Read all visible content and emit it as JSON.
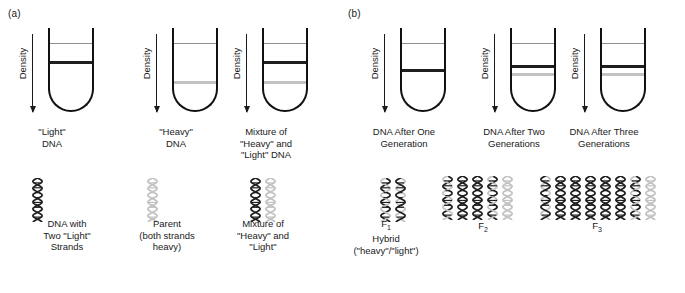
{
  "figure": {
    "panels": [
      {
        "label": "(a)"
      },
      {
        "label": "(b)"
      }
    ],
    "axis_label": "Density",
    "colors": {
      "heavy_strand": "#1f1f1f",
      "light_strand": "#c2c2c2",
      "tube_outline": "#111111",
      "meniscus": "#8e8e8e",
      "background": "#ffffff"
    }
  },
  "tubes": [
    {
      "id": "tube-light-dna",
      "axis_label": "Density",
      "caption": "\"Light\"\nDNA",
      "caption_lines": [
        "\"Light\"",
        "DNA"
      ],
      "bands": [
        {
          "type": "meniscus",
          "position_pct": 16
        },
        {
          "type": "dark",
          "position_pct": 36
        }
      ]
    },
    {
      "id": "tube-heavy-dna",
      "axis_label": "Density",
      "caption_lines": [
        "\"Heavy\"",
        "DNA"
      ],
      "bands": [
        {
          "type": "meniscus",
          "position_pct": 16
        },
        {
          "type": "light",
          "position_pct": 58
        }
      ]
    },
    {
      "id": "tube-mixture-heavy-light",
      "axis_label": "Density",
      "caption_lines": [
        "Mixture of",
        "\"Heavy\" and",
        "\"Light\" DNA"
      ],
      "bands": [
        {
          "type": "meniscus",
          "position_pct": 16
        },
        {
          "type": "dark",
          "position_pct": 36
        },
        {
          "type": "light",
          "position_pct": 58
        }
      ]
    },
    {
      "id": "tube-one-generation",
      "axis_label": "Density",
      "caption_lines": [
        "DNA After One",
        "Generation"
      ],
      "bands": [
        {
          "type": "meniscus",
          "position_pct": 16
        },
        {
          "type": "dark",
          "position_pct": 45
        }
      ]
    },
    {
      "id": "tube-two-generations",
      "axis_label": "Density",
      "caption_lines": [
        "DNA After Two",
        "Generations"
      ],
      "bands": [
        {
          "type": "meniscus",
          "position_pct": 16
        },
        {
          "type": "dark",
          "position_pct": 40
        },
        {
          "type": "light",
          "position_pct": 49
        }
      ]
    },
    {
      "id": "tube-three-generations",
      "axis_label": "Density",
      "caption_lines": [
        "DNA After Three",
        "Generations"
      ],
      "bands": [
        {
          "type": "meniscus",
          "position_pct": 16
        },
        {
          "type": "dark",
          "position_pct": 40
        },
        {
          "type": "light",
          "position_pct": 49
        }
      ]
    }
  ],
  "helix_groups": [
    {
      "id": "helix-light-dna",
      "caption_lines": [
        "DNA with",
        "Two \"Light\"",
        "Strands"
      ],
      "helices": [
        {
          "strands": [
            "dark",
            "dark"
          ]
        }
      ]
    },
    {
      "id": "helix-parent-heavy",
      "caption_lines": [
        "Parent",
        "(both strands",
        "heavy)"
      ],
      "helices": [
        {
          "strands": [
            "light",
            "light"
          ]
        }
      ]
    },
    {
      "id": "helix-mixture",
      "caption_lines": [
        "Mixture of",
        "\"Heavy\" and",
        "\"Light\""
      ],
      "helices": [
        {
          "strands": [
            "dark",
            "dark"
          ]
        },
        {
          "strands": [
            "light",
            "light"
          ]
        }
      ]
    },
    {
      "id": "helix-f1-hybrid",
      "caption_lines": [
        "F1",
        "Hybrid",
        "(\"heavy\"/\"light\")"
      ],
      "caption_main": "F",
      "caption_sub": "1",
      "helices": [
        {
          "strands": [
            "dark",
            "light"
          ]
        },
        {
          "strands": [
            "light",
            "dark"
          ]
        }
      ]
    },
    {
      "id": "helix-f2",
      "caption_main": "F",
      "caption_sub": "2",
      "caption_lines": [
        "F2"
      ],
      "helices": [
        {
          "strands": [
            "dark",
            "light"
          ]
        },
        {
          "strands": [
            "dark",
            "dark"
          ]
        },
        {
          "strands": [
            "dark",
            "dark"
          ]
        },
        {
          "strands": [
            "dark",
            "light"
          ]
        },
        {
          "strands": [
            "light",
            "light"
          ]
        }
      ]
    },
    {
      "id": "helix-f3",
      "caption_main": "F",
      "caption_sub": "3",
      "caption_lines": [
        "F3"
      ],
      "helices": [
        {
          "strands": [
            "light",
            "dark"
          ]
        },
        {
          "strands": [
            "dark",
            "dark"
          ]
        },
        {
          "strands": [
            "dark",
            "dark"
          ]
        },
        {
          "strands": [
            "dark",
            "dark"
          ]
        },
        {
          "strands": [
            "dark",
            "dark"
          ]
        },
        {
          "strands": [
            "dark",
            "dark"
          ]
        },
        {
          "strands": [
            "dark",
            "light"
          ]
        },
        {
          "strands": [
            "light",
            "light"
          ]
        }
      ]
    }
  ]
}
